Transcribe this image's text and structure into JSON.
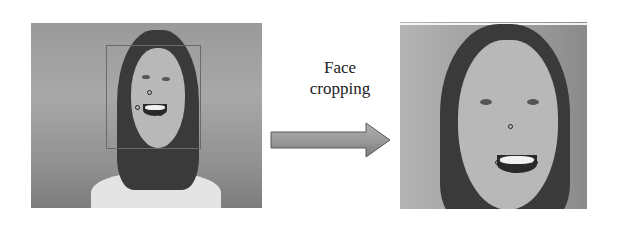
{
  "figure": {
    "source_image": {
      "label": "Original video frame with face bounding box and facial landmarks",
      "landmarks": [
        "nose",
        "mouth-left",
        "mouth-right"
      ]
    },
    "process": {
      "caption_line1": "Face",
      "caption_line2": "cropping",
      "arrow_direction": "right"
    },
    "result_image": {
      "label": "Cropped face region with landmarks"
    },
    "colors": {
      "arrow_fill": "#9a9a9a",
      "arrow_stroke": "#5a5a5a",
      "background": "#ffffff"
    }
  }
}
